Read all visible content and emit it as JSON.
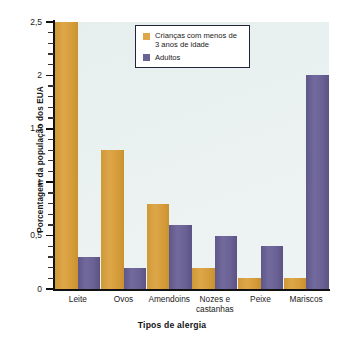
{
  "chart_data": {
    "type": "bar",
    "title": "",
    "xlabel": "Tipos de alergia",
    "ylabel": "Porcentagem da população dos EUA",
    "categories": [
      "Leite",
      "Ovos",
      "Amendoins",
      "Nozes e castanhas",
      "Peixe",
      "Mariscos"
    ],
    "category_lines": [
      [
        "Leite"
      ],
      [
        "Ovos"
      ],
      [
        "Amendoins"
      ],
      [
        "Nozes e",
        "castanhas"
      ],
      [
        "Peixe"
      ],
      [
        "Mariscos"
      ]
    ],
    "series": [
      {
        "name": "Crianças com menos de 3 anos de idade",
        "color": "#dda749",
        "values": [
          2.5,
          1.3,
          0.8,
          0.2,
          0.1,
          0.1
        ]
      },
      {
        "name": "Adultos",
        "color": "#6a6294",
        "values": [
          0.3,
          0.2,
          0.6,
          0.5,
          0.4,
          2.0
        ]
      }
    ],
    "ylim": [
      0,
      2.5
    ],
    "yticks": [
      0,
      0.5,
      1,
      1.5,
      2,
      2.5
    ],
    "ytick_labels": [
      "0",
      "0,5",
      "1",
      "1,5",
      "2",
      "2,5"
    ],
    "yminor_step": 0.1,
    "grid": false,
    "legend_position": "top-center",
    "legend_entries": [
      {
        "label_lines": [
          "Crianças com menos",
          "de 3 anos de idade"
        ],
        "color": "#dda749"
      },
      {
        "label_lines": [
          "Adultos"
        ],
        "color": "#6a6294"
      }
    ],
    "plot_background": "#eaf1f1"
  }
}
